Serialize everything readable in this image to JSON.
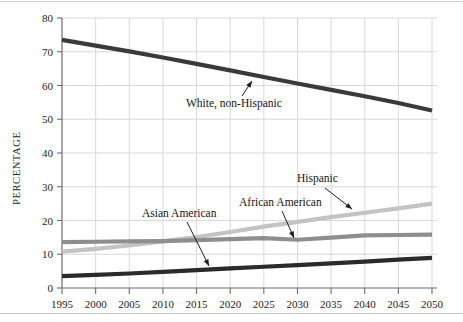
{
  "chart_data": {
    "type": "line",
    "title": "",
    "xlabel": "",
    "ylabel": "PERCENTAGE",
    "xlim": [
      1995,
      2050
    ],
    "ylim": [
      0,
      80
    ],
    "grid": true,
    "legend_position": "inline-annotations",
    "x": [
      1995,
      2000,
      2005,
      2010,
      2015,
      2020,
      2025,
      2030,
      2035,
      2040,
      2045,
      2050
    ],
    "xticklabels": [
      "1995",
      "2000",
      "2005",
      "2010",
      "2015",
      "2020",
      "2025",
      "2030",
      "2035",
      "2040",
      "2045",
      "2050"
    ],
    "yticklabels": [
      "0",
      "10",
      "20",
      "30",
      "40",
      "50",
      "60",
      "70",
      "80"
    ],
    "yticks": [
      0,
      10,
      20,
      30,
      40,
      50,
      60,
      70,
      80
    ],
    "series": [
      {
        "name": "White, non-Hispanic",
        "color": "#3a3a3a",
        "width": 4.2,
        "values": [
          73.5,
          71.8,
          70.1,
          68.3,
          66.4,
          64.5,
          62.5,
          60.6,
          58.7,
          56.8,
          54.8,
          52.6
        ]
      },
      {
        "name": "Hispanic",
        "color": "#c3c3c3",
        "width": 4.2,
        "values": [
          10.8,
          11.6,
          12.6,
          13.8,
          15.1,
          16.6,
          18.2,
          19.6,
          21.0,
          22.3,
          23.6,
          25.0
        ]
      },
      {
        "name": "African American",
        "color": "#8e8e8e",
        "width": 4.2,
        "values": [
          13.6,
          13.7,
          13.8,
          13.9,
          14.2,
          14.5,
          14.8,
          14.3,
          14.9,
          15.6,
          15.7,
          15.8
        ]
      },
      {
        "name": "Asian American",
        "color": "#2b2b2b",
        "width": 4.2,
        "values": [
          3.5,
          3.9,
          4.3,
          4.8,
          5.3,
          5.8,
          6.3,
          6.8,
          7.3,
          7.8,
          8.4,
          8.9
        ]
      }
    ],
    "annotations": [
      {
        "label": "White, non-Hispanic",
        "label_x": 186,
        "label_y": 107,
        "anchor": "start",
        "arrow_from_x": 242,
        "arrow_from_y": 96,
        "arrow_to_x": 252,
        "arrow_to_y": 81
      },
      {
        "label": "Asian American",
        "label_x": 142,
        "label_y": 217,
        "anchor": "start",
        "arrow_from_x": 187,
        "arrow_from_y": 222,
        "arrow_to_x": 209,
        "arrow_to_y": 266
      },
      {
        "label": "African American",
        "label_x": 239,
        "label_y": 206,
        "anchor": "start",
        "arrow_from_x": 282,
        "arrow_from_y": 211,
        "arrow_to_x": 294,
        "arrow_to_y": 238
      },
      {
        "label": "Hispanic",
        "label_x": 297,
        "label_y": 182,
        "anchor": "start",
        "arrow_from_x": 325,
        "arrow_from_y": 188,
        "arrow_to_x": 352,
        "arrow_to_y": 209
      }
    ]
  }
}
